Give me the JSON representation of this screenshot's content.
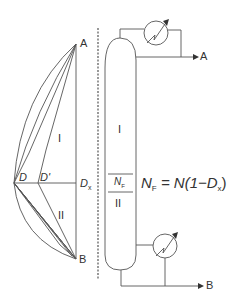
{
  "left_diagram": {
    "point_a": "A",
    "point_b": "B",
    "point_d": "D",
    "point_d_prime": "D'",
    "dx_main": "D",
    "dx_sub": "x",
    "region_upper": "I",
    "region_lower": "II"
  },
  "column": {
    "section_upper": "I",
    "section_lower": "II",
    "feed_main": "N",
    "feed_sub": "F",
    "top_product": "A",
    "bottom_product": "B"
  },
  "equation": {
    "lhs_main": "N",
    "lhs_sub": "F",
    "rhs_pre": " = N(1−D",
    "rhs_sub": "x",
    "rhs_post": ")"
  },
  "colors": {
    "line": "#555555",
    "text": "#333333"
  }
}
